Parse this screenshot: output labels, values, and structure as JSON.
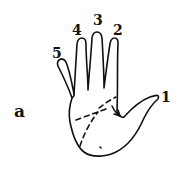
{
  "figure": {
    "panel_label": "a",
    "finger_labels": [
      {
        "id": "thumb",
        "label": "1"
      },
      {
        "id": "index",
        "label": "2"
      },
      {
        "id": "middle",
        "label": "3"
      },
      {
        "id": "ring",
        "label": "4"
      },
      {
        "id": "pinky",
        "label": "5"
      }
    ],
    "colors": {
      "line": "#111111",
      "background": "#ffffff"
    }
  }
}
